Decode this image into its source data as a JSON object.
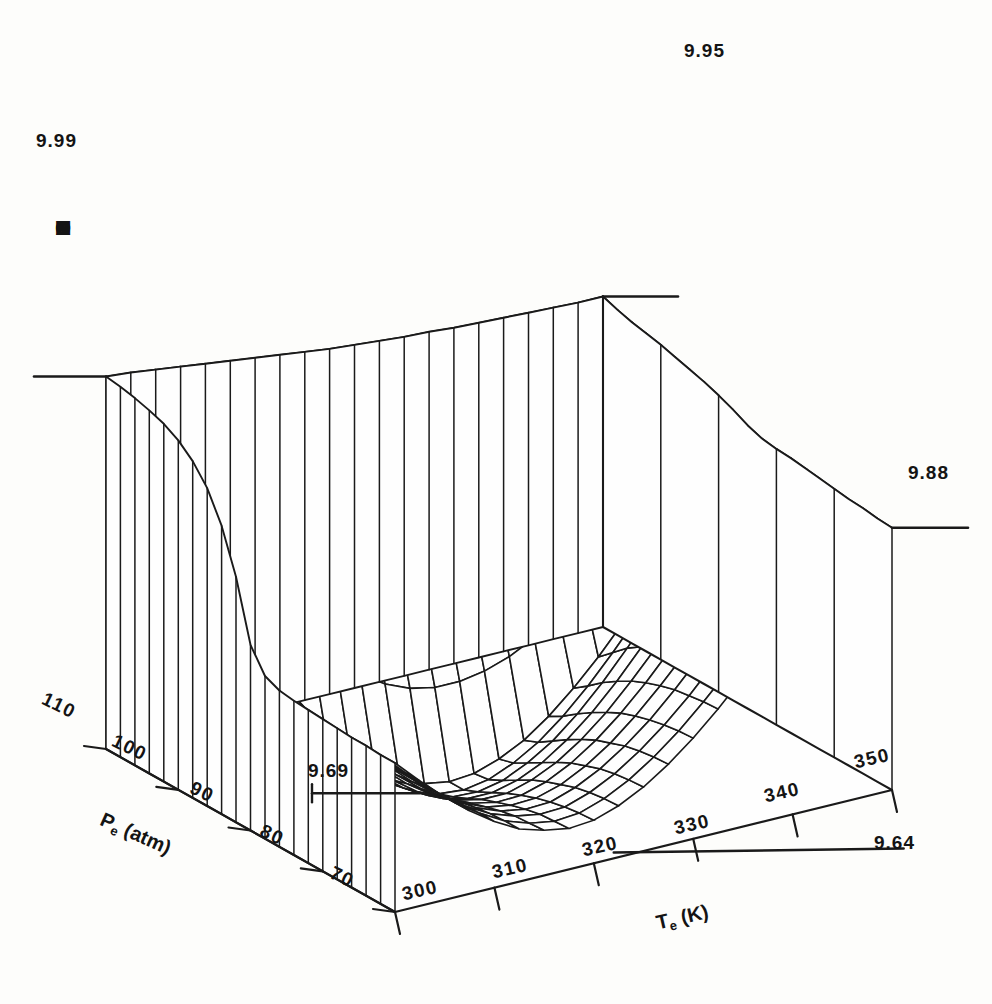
{
  "chart_data": {
    "type": "surface",
    "title": "",
    "zlabel": "MOLES ACETONE",
    "xlabel": "Pe (atm)",
    "ylabel": "Te (K)",
    "x_name": "Pe",
    "x_units": "atm",
    "y_name": "Te",
    "y_units": "K",
    "x_ticks": [
      110,
      100,
      90,
      80,
      70
    ],
    "y_ticks": [
      300,
      310,
      320,
      330,
      340,
      350
    ],
    "xlim": [
      70,
      110
    ],
    "ylim": [
      300,
      350
    ],
    "zlim": [
      9.64,
      9.99
    ],
    "grid": false,
    "legend": false,
    "corner_value_labels": [
      {
        "id": "back-left",
        "value": "9.99",
        "note": "high back-left corner, Pe=110 Te=300"
      },
      {
        "id": "back-right",
        "value": "9.95",
        "note": "back-top corner, Pe=110 Te=350"
      },
      {
        "id": "front-right",
        "value": "9.88",
        "note": "right corner, Pe=70 Te=350"
      },
      {
        "id": "front-low",
        "value": "9.64",
        "note": "valley minimum near front edge, Te~322"
      },
      {
        "id": "mid-left",
        "value": "9.69",
        "note": "local shelf on steep cliff, Pe~82"
      }
    ],
    "nx": 21,
    "ny": 21,
    "z_surface_rows_pe_110_to_70": [
      [
        9.99,
        9.988,
        9.985,
        9.982,
        9.979,
        9.976,
        9.973,
        9.97,
        9.967,
        9.964,
        9.962,
        9.96,
        9.958,
        9.957,
        9.955,
        9.954,
        9.953,
        9.952,
        9.951,
        9.95,
        9.95
      ],
      [
        9.988,
        9.985,
        9.982,
        9.978,
        9.974,
        9.97,
        9.966,
        9.962,
        9.959,
        9.956,
        9.953,
        9.951,
        9.949,
        9.948,
        9.947,
        9.946,
        9.946,
        9.945,
        9.945,
        9.945,
        9.945
      ],
      [
        9.985,
        9.981,
        9.977,
        9.972,
        9.967,
        9.962,
        9.957,
        9.953,
        9.949,
        9.946,
        9.943,
        9.941,
        9.939,
        9.938,
        9.938,
        9.938,
        9.938,
        9.939,
        9.939,
        9.94,
        9.941
      ],
      [
        9.981,
        9.976,
        9.97,
        9.964,
        9.958,
        9.952,
        9.946,
        9.941,
        9.937,
        9.934,
        9.931,
        9.929,
        9.928,
        9.928,
        9.928,
        9.929,
        9.93,
        9.932,
        9.934,
        9.936,
        9.938
      ],
      [
        9.976,
        9.969,
        9.962,
        9.954,
        9.946,
        9.939,
        9.932,
        9.927,
        9.922,
        9.919,
        9.917,
        9.915,
        9.915,
        9.916,
        9.917,
        9.919,
        9.922,
        9.925,
        9.928,
        9.932,
        9.935
      ],
      [
        9.968,
        9.959,
        9.95,
        9.94,
        9.93,
        9.921,
        9.913,
        9.907,
        9.902,
        9.899,
        9.897,
        9.896,
        9.897,
        9.899,
        9.902,
        9.906,
        9.91,
        9.915,
        9.92,
        9.925,
        9.931
      ],
      [
        9.956,
        9.944,
        9.932,
        9.919,
        9.907,
        9.896,
        9.886,
        9.879,
        9.874,
        9.871,
        9.87,
        9.87,
        9.873,
        9.877,
        9.882,
        9.888,
        9.895,
        9.902,
        9.91,
        9.918,
        9.927
      ],
      [
        9.938,
        9.922,
        9.906,
        9.89,
        9.875,
        9.861,
        9.85,
        9.842,
        9.837,
        9.834,
        9.834,
        9.836,
        9.841,
        9.848,
        9.856,
        9.866,
        9.876,
        9.887,
        9.898,
        9.91,
        9.923
      ],
      [
        9.91,
        9.889,
        9.868,
        9.848,
        9.829,
        9.812,
        9.799,
        9.79,
        9.785,
        9.783,
        9.785,
        9.789,
        9.797,
        9.807,
        9.82,
        9.834,
        9.849,
        9.865,
        9.881,
        9.898,
        9.918
      ],
      [
        9.869,
        9.842,
        9.815,
        9.79,
        9.767,
        9.747,
        9.732,
        9.722,
        9.717,
        9.717,
        9.721,
        9.729,
        9.741,
        9.756,
        9.774,
        9.793,
        9.814,
        9.836,
        9.858,
        9.881,
        9.912
      ],
      [
        9.812,
        9.778,
        9.745,
        9.714,
        9.687,
        9.665,
        9.649,
        9.639,
        9.635,
        9.637,
        9.645,
        9.657,
        9.674,
        9.695,
        9.719,
        9.746,
        9.774,
        9.803,
        9.833,
        9.864,
        9.905
      ],
      [
        9.79,
        9.76,
        9.731,
        9.703,
        9.679,
        9.659,
        9.645,
        9.637,
        9.635,
        9.639,
        9.649,
        9.663,
        9.682,
        9.705,
        9.731,
        9.759,
        9.789,
        9.82,
        9.852,
        9.884,
        9.9
      ],
      [
        9.784,
        9.756,
        9.729,
        9.703,
        9.68,
        9.662,
        9.649,
        9.642,
        9.641,
        9.646,
        9.657,
        9.672,
        9.692,
        9.716,
        9.743,
        9.772,
        9.803,
        9.834,
        9.866,
        9.897,
        9.898
      ],
      [
        9.782,
        9.755,
        9.729,
        9.705,
        9.683,
        9.666,
        9.654,
        9.648,
        9.648,
        9.654,
        9.665,
        9.681,
        9.701,
        9.725,
        9.752,
        9.781,
        9.811,
        9.842,
        9.872,
        9.9,
        9.897
      ],
      [
        9.781,
        9.755,
        9.73,
        9.707,
        9.687,
        9.671,
        9.66,
        9.655,
        9.655,
        9.662,
        9.673,
        9.689,
        9.709,
        9.733,
        9.759,
        9.788,
        9.817,
        9.847,
        9.876,
        9.901,
        9.895
      ],
      [
        9.78,
        9.755,
        9.731,
        9.709,
        9.69,
        9.675,
        9.665,
        9.66,
        9.661,
        9.668,
        9.68,
        9.696,
        9.716,
        9.739,
        9.765,
        9.792,
        9.821,
        9.85,
        9.878,
        9.902,
        9.893
      ],
      [
        9.779,
        9.755,
        9.732,
        9.711,
        9.693,
        9.679,
        9.669,
        9.665,
        9.666,
        9.673,
        9.685,
        9.701,
        9.721,
        9.744,
        9.769,
        9.796,
        9.824,
        9.852,
        9.879,
        9.902,
        9.891
      ],
      [
        9.778,
        9.755,
        9.733,
        9.713,
        9.696,
        9.682,
        9.673,
        9.669,
        9.67,
        9.678,
        9.69,
        9.706,
        9.725,
        9.748,
        9.773,
        9.799,
        9.826,
        9.853,
        9.88,
        9.902,
        9.889
      ],
      [
        9.778,
        9.755,
        9.733,
        9.714,
        9.697,
        9.684,
        9.676,
        9.672,
        9.673,
        9.681,
        9.693,
        9.709,
        9.728,
        9.75,
        9.775,
        9.801,
        9.828,
        9.854,
        9.88,
        9.901,
        9.888
      ],
      [
        9.777,
        9.754,
        9.733,
        9.714,
        9.698,
        9.685,
        9.677,
        9.673,
        9.675,
        9.683,
        9.695,
        9.711,
        9.73,
        9.752,
        9.776,
        9.802,
        9.828,
        9.854,
        9.88,
        9.9,
        9.886
      ],
      [
        9.777,
        9.754,
        9.733,
        9.714,
        9.698,
        9.685,
        9.678,
        9.674,
        9.676,
        9.684,
        9.696,
        9.712,
        9.731,
        9.753,
        9.777,
        9.802,
        9.828,
        9.854,
        9.879,
        9.899,
        9.885
      ]
    ]
  },
  "axes": {
    "z_axis": {
      "label": "MOLES ACETONE",
      "letters": [
        "M",
        "O",
        "L",
        "E",
        "S",
        "",
        "A",
        "C",
        "E",
        "T",
        "O",
        "N",
        "E"
      ]
    },
    "x_axis": {
      "label_main": "P",
      "label_sub": "e",
      "label_unit": " (atm)",
      "ticks": [
        "110",
        "100",
        "90",
        "80",
        "70"
      ]
    },
    "y_axis": {
      "label_main": "T",
      "label_sub": "e",
      "label_unit": " (K)",
      "ticks": [
        "300",
        "310",
        "320",
        "330",
        "340",
        "350"
      ]
    }
  },
  "annotations": [
    {
      "name": "value-label-top-left",
      "text": "9.99"
    },
    {
      "name": "value-label-top-right",
      "text": "9.95"
    },
    {
      "name": "value-label-right",
      "text": "9.88"
    },
    {
      "name": "value-label-bottom",
      "text": "9.64"
    },
    {
      "name": "value-label-interior",
      "text": "9.69"
    }
  ],
  "colors": {
    "background": "#fdfdfb",
    "ink": "#141414",
    "mesh": "#1a1a1a"
  }
}
